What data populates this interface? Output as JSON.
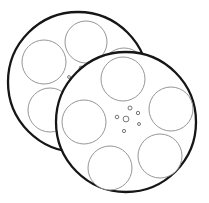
{
  "canvas": {
    "width": 209,
    "height": 203,
    "background_color": "#ffffff",
    "title": "Two overlapping film reels line drawing"
  },
  "style": {
    "rim_color": "#161616",
    "rim_width": 2.3,
    "hole_color": "#8a8a8a",
    "hole_width": 0.9,
    "hub_dot_color": "#555555",
    "hub_dot_width": 0.8,
    "fill_color": "#ffffff"
  },
  "objects": [
    {
      "name": "back-reel",
      "label": "Back film reel",
      "order": 1,
      "rim": {
        "cx": 78,
        "cy": 82,
        "r": 70
      },
      "holes": [
        {
          "name": "hole-top",
          "cx": 86,
          "cy": 42,
          "r": 21
        },
        {
          "name": "hole-left-upper",
          "cx": 44,
          "cy": 62,
          "r": 22
        },
        {
          "name": "hole-left-lower",
          "cx": 50,
          "cy": 110,
          "r": 22
        },
        {
          "name": "hole-right",
          "cx": 124,
          "cy": 70,
          "r": 22
        }
      ],
      "hub": {
        "cx": 78,
        "cy": 78,
        "dots": [
          {
            "cx": 81,
            "cy": 68,
            "r": 1.9
          },
          {
            "cx": 69,
            "cy": 77,
            "r": 1.4
          },
          {
            "cx": 88,
            "cy": 74,
            "r": 1.1
          },
          {
            "cx": 74,
            "cy": 86,
            "r": 1.0
          }
        ]
      }
    },
    {
      "name": "front-reel",
      "label": "Front film reel",
      "order": 2,
      "rim": {
        "cx": 126,
        "cy": 122,
        "r": 70
      },
      "holes": [
        {
          "name": "hole-top",
          "cx": 123,
          "cy": 79,
          "r": 22
        },
        {
          "name": "hole-upper-right",
          "cx": 171,
          "cy": 109,
          "r": 22
        },
        {
          "name": "hole-lower-right",
          "cx": 160,
          "cy": 156,
          "r": 22
        },
        {
          "name": "hole-bottom",
          "cx": 110,
          "cy": 168,
          "r": 22
        },
        {
          "name": "hole-left",
          "cx": 84,
          "cy": 122,
          "r": 22
        }
      ],
      "hub": {
        "cx": 126,
        "cy": 118,
        "dots": [
          {
            "cx": 130,
            "cy": 108,
            "r": 2.0
          },
          {
            "cx": 117,
            "cy": 117,
            "r": 1.8
          },
          {
            "cx": 126,
            "cy": 119,
            "r": 2.9
          },
          {
            "cx": 138,
            "cy": 113,
            "r": 1.7
          },
          {
            "cx": 139,
            "cy": 124,
            "r": 1.5
          },
          {
            "cx": 124,
            "cy": 131,
            "r": 1.6
          }
        ]
      }
    }
  ]
}
